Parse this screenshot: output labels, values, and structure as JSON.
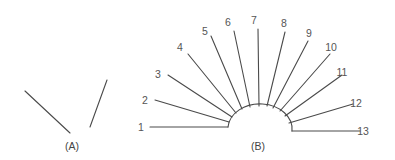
{
  "panel_a": {
    "caption": "(A)",
    "lines": [
      {
        "x1": 25,
        "y1": 91,
        "x2": 70,
        "y2": 133
      },
      {
        "x1": 107,
        "y1": 80,
        "x2": 90,
        "y2": 127
      }
    ]
  },
  "panel_b": {
    "caption": "(B)",
    "arc": {
      "cx": 260,
      "cy": 131,
      "rx": 32,
      "ry": 25
    },
    "rays": [
      {
        "label": "1",
        "x1": 150,
        "y1": 127,
        "x2": 228,
        "y2": 127,
        "lx": 141,
        "ly": 131
      },
      {
        "label": "2",
        "x1": 155,
        "y1": 100,
        "x2": 229,
        "y2": 122,
        "lx": 145,
        "ly": 104
      },
      {
        "label": "3",
        "x1": 168,
        "y1": 75,
        "x2": 232,
        "y2": 117,
        "lx": 158,
        "ly": 78
      },
      {
        "label": "4",
        "x1": 188,
        "y1": 54,
        "x2": 236,
        "y2": 113,
        "lx": 180,
        "ly": 51
      },
      {
        "label": "5",
        "x1": 211,
        "y1": 36,
        "x2": 242,
        "y2": 109,
        "lx": 205,
        "ly": 35
      },
      {
        "label": "6",
        "x1": 234,
        "y1": 31,
        "x2": 250,
        "y2": 107,
        "lx": 228,
        "ly": 26
      },
      {
        "label": "7",
        "x1": 258,
        "y1": 29,
        "x2": 259,
        "y2": 106,
        "lx": 254,
        "ly": 24
      },
      {
        "label": "8",
        "x1": 285,
        "y1": 32,
        "x2": 267,
        "y2": 106,
        "lx": 284,
        "ly": 27
      },
      {
        "label": "9",
        "x1": 308,
        "y1": 41,
        "x2": 273,
        "y2": 108,
        "lx": 309,
        "ly": 37
      },
      {
        "label": "10",
        "x1": 330,
        "y1": 54,
        "x2": 280,
        "y2": 111,
        "lx": 331,
        "ly": 51
      },
      {
        "label": "11",
        "x1": 342,
        "y1": 75,
        "x2": 285,
        "y2": 116,
        "lx": 342,
        "ly": 76
      },
      {
        "label": "12",
        "x1": 353,
        "y1": 104,
        "x2": 289,
        "y2": 123,
        "lx": 356,
        "ly": 107
      },
      {
        "label": "13",
        "x1": 360,
        "y1": 131,
        "x2": 292,
        "y2": 131,
        "lx": 363,
        "ly": 135
      }
    ]
  }
}
